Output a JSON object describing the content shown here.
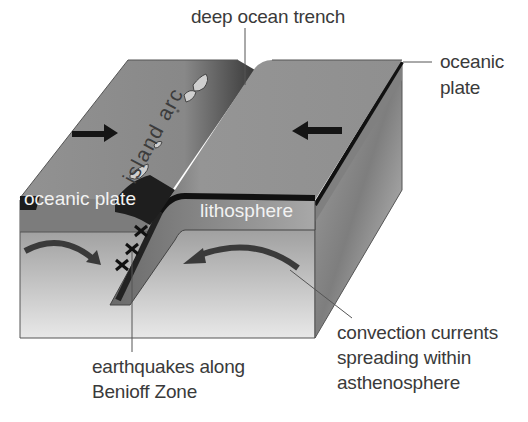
{
  "diagram": {
    "type": "block-diagram",
    "labels": {
      "deep_ocean_trench": "deep ocean trench",
      "oceanic_plate_right_line1": "oceanic",
      "oceanic_plate_right_line2": "plate",
      "island_arc": "island arc",
      "oceanic_plate_left": "oceanic plate",
      "lithosphere": "lithosphere",
      "benioff_line1": "earthquakes along",
      "benioff_line2": "Benioff Zone",
      "convection_line1": "convection currents",
      "convection_line2": "spreading within",
      "convection_line3": "asthenosphere"
    },
    "arrows": [
      {
        "name": "left-plate-motion",
        "direction": "right"
      },
      {
        "name": "right-plate-motion",
        "direction": "left"
      }
    ],
    "earthquake_markers": 3,
    "colors": {
      "top_face": "#8e8e8e",
      "lithosphere_band": "#7a7a7a",
      "dark_edge": "#1a1a1a",
      "asthenosphere_top": "#8a8a8a",
      "asthenosphere_bottom": "#e6e6e6",
      "text": "#3a3a3a",
      "leader_line": "#555555"
    }
  }
}
